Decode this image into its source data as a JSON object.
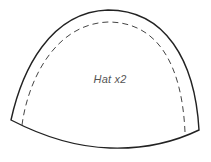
{
  "pattern": {
    "piece_label": "Hat x2",
    "outline_color": "#222222",
    "seam_color": "#444444",
    "text_color": "#555555"
  }
}
